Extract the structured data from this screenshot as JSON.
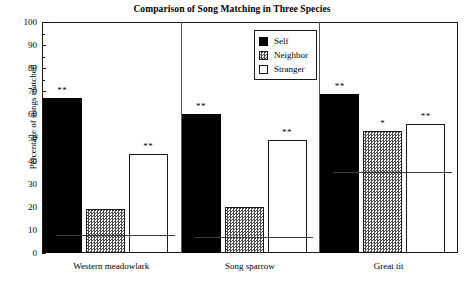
{
  "chart_data": {
    "type": "bar",
    "title": "Comparison of Song Matching in Three Species",
    "xlabel": "",
    "ylabel": "Percentage of songs matched",
    "ylim": [
      0,
      100
    ],
    "ytick_step": 10,
    "yticks": [
      "0",
      "10",
      "20",
      "30",
      "40",
      "50",
      "60",
      "70",
      "80",
      "90",
      "100"
    ],
    "grid": false,
    "legend_position": "top-right-inside",
    "categories": [
      "Western meadowlark",
      "Song sparrow",
      "Great tit"
    ],
    "series": [
      {
        "name": "Self",
        "values": [
          67,
          60,
          69
        ],
        "color": "#000000",
        "fill": "solid-black"
      },
      {
        "name": "Neighbor",
        "values": [
          19,
          20,
          53
        ],
        "color": "#4a4a4a",
        "fill": "checkered"
      },
      {
        "name": "Stranger",
        "values": [
          43,
          49,
          56
        ],
        "color": "#ffffff",
        "fill": "white"
      }
    ],
    "significance_markers": [
      {
        "category": "Western meadowlark",
        "series": "Self",
        "label": "**"
      },
      {
        "category": "Western meadowlark",
        "series": "Neighbor",
        "label": ""
      },
      {
        "category": "Western meadowlark",
        "series": "Stranger",
        "label": "**"
      },
      {
        "category": "Song sparrow",
        "series": "Self",
        "label": "**"
      },
      {
        "category": "Song sparrow",
        "series": "Neighbor",
        "label": ""
      },
      {
        "category": "Song sparrow",
        "series": "Stranger",
        "label": "**"
      },
      {
        "category": "Great tit",
        "series": "Self",
        "label": "**"
      },
      {
        "category": "Great tit",
        "series": "Neighbor",
        "label": "*"
      },
      {
        "category": "Great tit",
        "series": "Stranger",
        "label": "**"
      }
    ],
    "reference_lines": [
      {
        "category": "Western meadowlark",
        "value": 8
      },
      {
        "category": "Song sparrow",
        "value": 7
      },
      {
        "category": "Great tit",
        "value": 35
      }
    ]
  },
  "legend": {
    "entries": [
      {
        "label": "Self",
        "swatch": "black-square-icon"
      },
      {
        "label": "Neighbor",
        "swatch": "checkered-square-icon"
      },
      {
        "label": "Stranger",
        "swatch": "white-square-icon"
      }
    ]
  }
}
